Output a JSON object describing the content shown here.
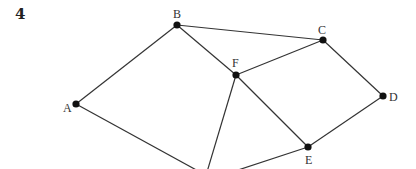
{
  "question_number": "4",
  "graph": {
    "nodes": [
      {
        "id": "A",
        "label": "A",
        "x": 76,
        "y": 104,
        "lx": 63,
        "ly": 112
      },
      {
        "id": "B",
        "label": "B",
        "x": 177,
        "y": 25,
        "lx": 173,
        "ly": 18
      },
      {
        "id": "C",
        "label": "C",
        "x": 323,
        "y": 40,
        "lx": 318,
        "ly": 34
      },
      {
        "id": "D",
        "label": "D",
        "x": 383,
        "y": 96,
        "lx": 389,
        "ly": 101
      },
      {
        "id": "E",
        "label": "E",
        "x": 308,
        "y": 147,
        "lx": 305,
        "ly": 164
      },
      {
        "id": "F",
        "label": "F",
        "x": 236,
        "y": 75,
        "lx": 232,
        "ly": 67
      }
    ],
    "edges": [
      [
        "A",
        "B"
      ],
      [
        "B",
        "C"
      ],
      [
        "B",
        "F"
      ],
      [
        "F",
        "C"
      ],
      [
        "C",
        "D"
      ],
      [
        "F",
        "E"
      ],
      [
        "D",
        "E"
      ]
    ],
    "offscreen_edges": [
      {
        "from": "A",
        "x2": 200,
        "y2": 172
      },
      {
        "from": "F",
        "x2": 207,
        "y2": 172
      },
      {
        "from": "E",
        "x2": 232,
        "y2": 172
      }
    ],
    "colors": {
      "edge": "#333333",
      "node": "#111111",
      "label": "#333333"
    }
  }
}
